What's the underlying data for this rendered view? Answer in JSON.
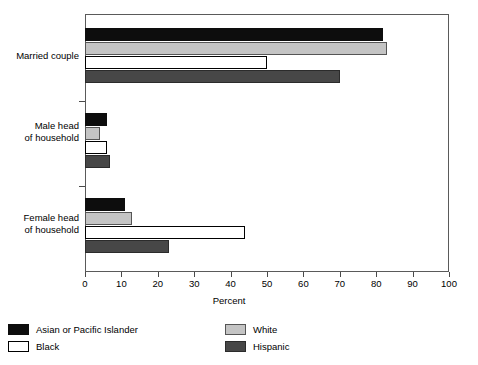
{
  "chart_data": {
    "type": "bar",
    "orientation": "horizontal",
    "title": "",
    "subtitle": "",
    "xlabel": "Percent",
    "ylabel": "",
    "xlim": [
      0,
      100
    ],
    "xticks": [
      0,
      10,
      20,
      30,
      40,
      50,
      60,
      70,
      80,
      90,
      100
    ],
    "xtick_labels": [
      "0",
      "10",
      "20",
      "30",
      "40",
      "50",
      "60",
      "70",
      "80",
      "90",
      "100"
    ],
    "grid": false,
    "legend_position": "below-axis-two-columns",
    "categories": [
      "Married couple",
      "Male head\nof household",
      "Female head\nof household"
    ],
    "series": [
      {
        "name": "Asian or Pacific Islander",
        "color": "#0d0d0d",
        "values": [
          82,
          6,
          11
        ]
      },
      {
        "name": "White",
        "color": "#c4c4c4",
        "values": [
          83,
          4,
          13
        ]
      },
      {
        "name": "Black",
        "color": "#ffffff",
        "values": [
          50,
          6,
          44
        ]
      },
      {
        "name": "Hispanic",
        "color": "#474747",
        "values": [
          70,
          7,
          23
        ]
      }
    ]
  },
  "axis": {
    "x_title": "Percent"
  },
  "legend": {
    "items": [
      {
        "label": "Asian or Pacific Islander",
        "swatch": "s-asian"
      },
      {
        "label": "Black",
        "swatch": "s-black"
      },
      {
        "label": "White",
        "swatch": "s-white"
      },
      {
        "label": "Hispanic",
        "swatch": "s-hispanic"
      }
    ]
  },
  "colors": {
    "asian_or_pacific_islander": "#0d0d0d",
    "white": "#c4c4c4",
    "black": "#ffffff",
    "hispanic": "#474747",
    "frame": "#5a5a5a",
    "text": "#000000"
  }
}
